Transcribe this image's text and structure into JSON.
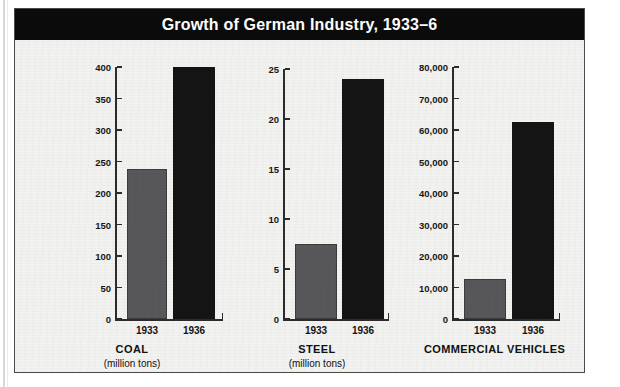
{
  "figure": {
    "title": "Growth of German Industry, 1933–6"
  },
  "chart_data": [
    {
      "type": "bar",
      "title": "COAL",
      "subtitle": "(million tons)",
      "xlabel": "",
      "ylabel": "",
      "categories": [
        "1933",
        "1936"
      ],
      "values": [
        237,
        400
      ],
      "ylim": [
        0,
        400
      ],
      "yticks": [
        0,
        50,
        100,
        150,
        200,
        250,
        300,
        350,
        400
      ],
      "ytick_labels": [
        "0",
        "50",
        "100",
        "150",
        "200",
        "250",
        "300",
        "350",
        "400"
      ],
      "bar_colors": [
        "#58585a",
        "#141414"
      ],
      "grid": false,
      "legend": "none"
    },
    {
      "type": "bar",
      "title": "STEEL",
      "subtitle": "(million tons)",
      "xlabel": "",
      "ylabel": "",
      "categories": [
        "1933",
        "1936"
      ],
      "values": [
        7.5,
        23.6
      ],
      "ylim": [
        0,
        25
      ],
      "yticks": [
        0,
        5,
        10,
        15,
        20,
        25
      ],
      "ytick_labels": [
        "0",
        "5",
        "10",
        "15",
        "20",
        "25"
      ],
      "bar_colors": [
        "#58585a",
        "#141414"
      ],
      "grid": false,
      "legend": "none"
    },
    {
      "type": "bar",
      "title": "COMMERCIAL VEHICLES",
      "subtitle": "",
      "xlabel": "",
      "ylabel": "",
      "categories": [
        "1933",
        "1936"
      ],
      "values": [
        12700,
        62800
      ],
      "ylim": [
        0,
        80000
      ],
      "yticks": [
        0,
        10000,
        20000,
        30000,
        40000,
        50000,
        60000,
        70000,
        80000
      ],
      "ytick_labels": [
        "0",
        "10,000",
        "20,000",
        "30,000",
        "40,000",
        "50,000",
        "60,000",
        "70,000",
        "80,000"
      ],
      "bar_colors": [
        "#58585a",
        "#141414"
      ],
      "grid": false,
      "legend": "none"
    }
  ],
  "colors": {
    "title_bar_bg": "#0b0b0b",
    "title_bar_text": "#ffffff",
    "plate_bg": "#f2f2f0",
    "plate_border": "#4a4a4a",
    "axis": "#2c2c2c",
    "bar_1933": "#58585a",
    "bar_1936": "#141414"
  }
}
